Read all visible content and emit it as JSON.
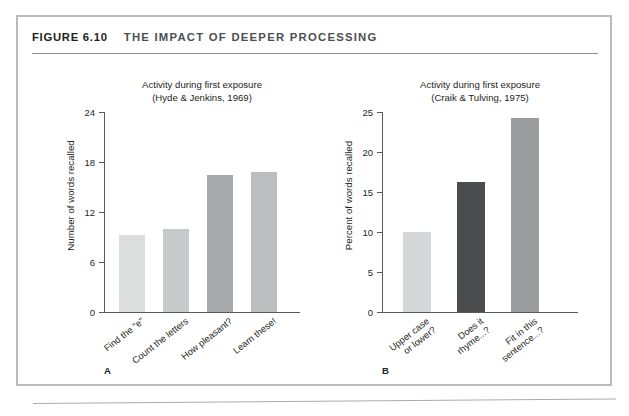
{
  "figure": {
    "number": "FIGURE 6.10",
    "title": "THE IMPACT OF DEEPER PROCESSING"
  },
  "panels": [
    {
      "letter": "A",
      "title_line1": "Activity during first exposure",
      "title_line2": "(Hyde & Jenkins, 1969)"
    },
    {
      "letter": "B",
      "title_line1": "Activity during first exposure",
      "title_line2": "(Craik & Tulving, 1975)"
    }
  ],
  "chart_data": [
    {
      "type": "bar",
      "panel": "A",
      "title": "Activity during first exposure (Hyde & Jenkins, 1969)",
      "xlabel": "",
      "ylabel": "Number of words recalled",
      "ylim": [
        0,
        24
      ],
      "yticks": [
        0,
        6,
        12,
        18,
        24
      ],
      "ytick_labels": [
        "0",
        "6",
        "12",
        "18",
        "24"
      ],
      "grid": false,
      "legend": "none",
      "categories": [
        "Find the \"e\"",
        "Count the letters",
        "How pleasant?",
        "Learn these!"
      ],
      "category_lines": [
        [
          "Find the \"e\""
        ],
        [
          "Count the letters"
        ],
        [
          "How pleasant?"
        ],
        [
          "Learn these!"
        ]
      ],
      "values": [
        9.3,
        10.0,
        16.5,
        16.8
      ],
      "bar_colors": [
        "#dcdddd",
        "#c8c9ca",
        "#a8aaac",
        "#bcbec0"
      ]
    },
    {
      "type": "bar",
      "panel": "B",
      "title": "Activity during first exposure (Craik & Tulving, 1975)",
      "xlabel": "",
      "ylabel": "Percent of words recalled",
      "ylim": [
        0,
        25
      ],
      "yticks": [
        0,
        5,
        10,
        15,
        20,
        25
      ],
      "ytick_labels": [
        "0",
        "5",
        "10",
        "15",
        "20",
        "25"
      ],
      "grid": false,
      "legend": "none",
      "categories": [
        "Upper case or lower?",
        "Does it rhyme...?",
        "Fit in this sentence...?"
      ],
      "category_lines": [
        [
          "Upper case",
          "or lower?"
        ],
        [
          "Does it",
          "rhyme...?"
        ],
        [
          "Fit in this",
          "sentence...?"
        ]
      ],
      "values": [
        10.0,
        16.2,
        24.2
      ],
      "bar_colors": [
        "#d6d7d8",
        "#4a4c4e",
        "#9a9c9e"
      ]
    }
  ],
  "colors": {
    "frame": "#b9bcbe",
    "rule": "#8d9093",
    "axis": "#58595b",
    "text": "#231f20",
    "title_gray": "#4c4f52"
  }
}
